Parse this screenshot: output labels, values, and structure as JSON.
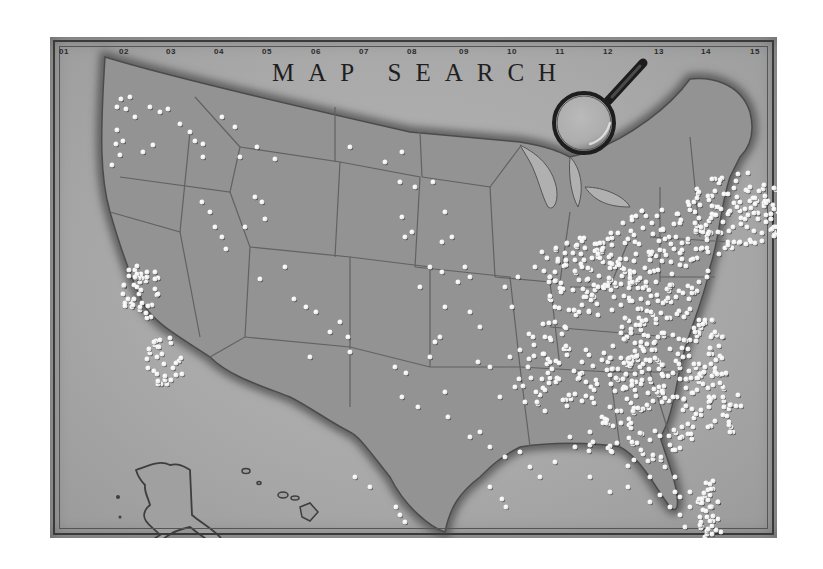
{
  "map": {
    "title": "MAP SEARCH",
    "grid_columns": [
      "01",
      "02",
      "03",
      "04",
      "05",
      "06",
      "07",
      "08",
      "09",
      "10",
      "11",
      "12",
      "13",
      "14",
      "15"
    ],
    "colors": {
      "board": "#a9a9a9",
      "land": "#8f8f8f",
      "coast_shadow": "#5a5a5a",
      "state_lines": "#5f5f5f",
      "pin": "#f4f4f4",
      "frame": "#3a3a3a",
      "title": "#1f1f1f"
    },
    "insets": [
      "Alaska",
      "Hawaii"
    ],
    "tool_icon": "magnifying-glass",
    "pin_count_approx": 900
  },
  "pins": [
    [
      67,
      70
    ],
    [
      71,
      62
    ],
    [
      80,
      60
    ],
    [
      85,
      80
    ],
    [
      67,
      93
    ],
    [
      76,
      72
    ],
    [
      62,
      128
    ],
    [
      70,
      118
    ],
    [
      66,
      107
    ],
    [
      73,
      104
    ],
    [
      100,
      70
    ],
    [
      110,
      75
    ],
    [
      118,
      72
    ],
    [
      93,
      115
    ],
    [
      103,
      108
    ],
    [
      130,
      87
    ],
    [
      140,
      95
    ],
    [
      145,
      104
    ],
    [
      172,
      80
    ],
    [
      185,
      90
    ],
    [
      153,
      107
    ],
    [
      153,
      120
    ],
    [
      190,
      120
    ],
    [
      207,
      110
    ],
    [
      225,
      122
    ],
    [
      212,
      165
    ],
    [
      205,
      160
    ],
    [
      215,
      182
    ],
    [
      195,
      190
    ],
    [
      152,
      165
    ],
    [
      160,
      175
    ],
    [
      165,
      190
    ],
    [
      172,
      200
    ],
    [
      176,
      212
    ],
    [
      210,
      242
    ],
    [
      235,
      230
    ],
    [
      256,
      270
    ],
    [
      244,
      262
    ],
    [
      266,
      275
    ],
    [
      280,
      295
    ],
    [
      290,
      285
    ],
    [
      298,
      300
    ],
    [
      300,
      315
    ],
    [
      260,
      320
    ],
    [
      300,
      110
    ],
    [
      352,
      115
    ],
    [
      335,
      125
    ],
    [
      350,
      145
    ],
    [
      365,
      150
    ],
    [
      383,
      145
    ],
    [
      395,
      175
    ],
    [
      402,
      200
    ],
    [
      380,
      230
    ],
    [
      392,
      235
    ],
    [
      408,
      245
    ],
    [
      420,
      240
    ],
    [
      355,
      200
    ],
    [
      362,
      195
    ],
    [
      392,
      205
    ],
    [
      352,
      180
    ],
    [
      415,
      230
    ],
    [
      370,
      250
    ],
    [
      395,
      270
    ],
    [
      420,
      275
    ],
    [
      390,
      300
    ],
    [
      430,
      290
    ],
    [
      428,
      325
    ],
    [
      440,
      330
    ],
    [
      345,
      330
    ],
    [
      356,
      336
    ],
    [
      380,
      320
    ],
    [
      385,
      305
    ],
    [
      352,
      360
    ],
    [
      368,
      370
    ],
    [
      395,
      355
    ],
    [
      398,
      380
    ],
    [
      420,
      400
    ],
    [
      430,
      395
    ],
    [
      460,
      320
    ],
    [
      470,
      313
    ],
    [
      478,
      330
    ],
    [
      495,
      300
    ],
    [
      505,
      285
    ],
    [
      515,
      290
    ],
    [
      462,
      270
    ],
    [
      455,
      250
    ],
    [
      468,
      240
    ],
    [
      485,
      230
    ],
    [
      492,
      215
    ],
    [
      500,
      240
    ],
    [
      500,
      262
    ],
    [
      505,
      270
    ],
    [
      440,
      410
    ],
    [
      455,
      420
    ],
    [
      470,
      415
    ],
    [
      480,
      430
    ],
    [
      490,
      440
    ],
    [
      505,
      425
    ],
    [
      520,
      400
    ],
    [
      525,
      410
    ],
    [
      540,
      395
    ],
    [
      552,
      380
    ],
    [
      560,
      370
    ],
    [
      450,
      360
    ],
    [
      465,
      350
    ],
    [
      475,
      365
    ],
    [
      440,
      450
    ],
    [
      452,
      462
    ],
    [
      456,
      470
    ],
    [
      346,
      470
    ],
    [
      350,
      478
    ],
    [
      355,
      485
    ],
    [
      320,
      450
    ],
    [
      305,
      440
    ],
    [
      540,
      440
    ],
    [
      560,
      455
    ],
    [
      578,
      450
    ],
    [
      600,
      440
    ],
    [
      615,
      430
    ],
    [
      625,
      440
    ],
    [
      630,
      460
    ],
    [
      640,
      470
    ],
    [
      650,
      480
    ],
    [
      652,
      490
    ],
    [
      660,
      470
    ],
    [
      668,
      482
    ],
    [
      671,
      495
    ],
    [
      655,
      500
    ],
    [
      650,
      510
    ],
    [
      635,
      490
    ],
    [
      630,
      478
    ],
    [
      620,
      470
    ],
    [
      600,
      465
    ],
    [
      610,
      458
    ],
    [
      625,
      455
    ],
    [
      640,
      455
    ],
    [
      648,
      465
    ],
    [
      660,
      458
    ],
    [
      662,
      505
    ],
    [
      668,
      512
    ]
  ],
  "pin_clusters": [
    {
      "cx": 92,
      "cy": 255,
      "rx": 20,
      "ry": 30,
      "n": 45
    },
    {
      "cx": 115,
      "cy": 325,
      "rx": 20,
      "ry": 25,
      "n": 30
    },
    {
      "cx": 540,
      "cy": 240,
      "rx": 50,
      "ry": 40,
      "n": 110
    },
    {
      "cx": 610,
      "cy": 220,
      "rx": 60,
      "ry": 50,
      "n": 130
    },
    {
      "cx": 690,
      "cy": 175,
      "rx": 55,
      "ry": 40,
      "n": 120
    },
    {
      "cx": 620,
      "cy": 310,
      "rx": 55,
      "ry": 55,
      "n": 140
    },
    {
      "cx": 570,
      "cy": 345,
      "rx": 50,
      "ry": 45,
      "n": 90
    },
    {
      "cx": 660,
      "cy": 370,
      "rx": 35,
      "ry": 40,
      "n": 60
    },
    {
      "cx": 660,
      "cy": 470,
      "rx": 14,
      "ry": 30,
      "n": 35
    },
    {
      "cx": 500,
      "cy": 330,
      "rx": 35,
      "ry": 45,
      "n": 50
    },
    {
      "cx": 585,
      "cy": 405,
      "rx": 50,
      "ry": 25,
      "n": 40
    }
  ]
}
